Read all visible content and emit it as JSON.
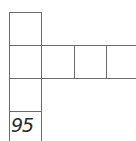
{
  "grid": {
    "line_color": "#6b6b6b",
    "cells": [
      {
        "row": 0,
        "col": 0,
        "label": ""
      },
      {
        "row": 1,
        "col": 0,
        "label": ""
      },
      {
        "row": 1,
        "col": 1,
        "label": ""
      },
      {
        "row": 1,
        "col": 2,
        "label": ""
      },
      {
        "row": 1,
        "col": 3,
        "label": ""
      },
      {
        "row": 2,
        "col": 0,
        "label": ""
      },
      {
        "row": 3,
        "col": 0,
        "label": "95"
      }
    ]
  },
  "clue_number": "95"
}
